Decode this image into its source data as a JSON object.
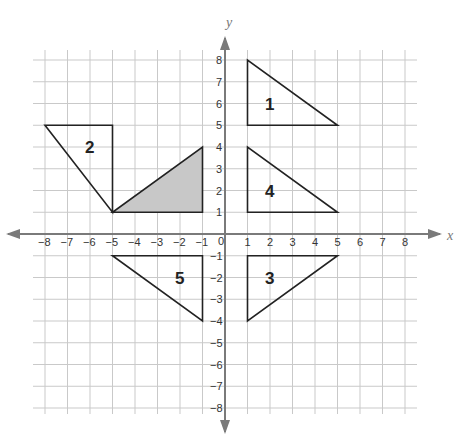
{
  "axes": {
    "x_label": "x",
    "y_label": "y",
    "x_range": [
      -8,
      8
    ],
    "y_range": [
      -8,
      8
    ],
    "origin_label": "0",
    "x_ticks": [
      "−8",
      "−7",
      "−6",
      "−5",
      "−4",
      "−3",
      "−2",
      "−1",
      "1",
      "2",
      "3",
      "4",
      "5",
      "6",
      "7",
      "8"
    ],
    "y_ticks": [
      "8",
      "7",
      "6",
      "5",
      "4",
      "3",
      "2",
      "1",
      "−1",
      "−2",
      "−3",
      "−4",
      "−5",
      "−6",
      "−7",
      "−8"
    ]
  },
  "colors": {
    "grid": "#c9c9c9",
    "axis": "#7a7a7a",
    "outline": "#222222",
    "shaded_fill": "#c8c8c8"
  },
  "shapes": [
    {
      "id": "shaded",
      "label": "",
      "shaded": true,
      "vertices": [
        [
          -5,
          1
        ],
        [
          -1,
          1
        ],
        [
          -1,
          4
        ]
      ],
      "label_at": null
    },
    {
      "id": "1",
      "label": "1",
      "shaded": false,
      "vertices": [
        [
          1,
          8
        ],
        [
          1,
          5
        ],
        [
          5,
          5
        ]
      ],
      "label_at": [
        2,
        6
      ]
    },
    {
      "id": "2",
      "label": "2",
      "shaded": false,
      "vertices": [
        [
          -8,
          5
        ],
        [
          -5,
          5
        ],
        [
          -5,
          1
        ]
      ],
      "label_at": [
        -6,
        4
      ]
    },
    {
      "id": "3",
      "label": "3",
      "shaded": false,
      "vertices": [
        [
          1,
          -1
        ],
        [
          5,
          -1
        ],
        [
          1,
          -4
        ]
      ],
      "label_at": [
        2,
        -2
      ]
    },
    {
      "id": "4",
      "label": "4",
      "shaded": false,
      "vertices": [
        [
          1,
          4
        ],
        [
          1,
          1
        ],
        [
          5,
          1
        ]
      ],
      "label_at": [
        2,
        2
      ]
    },
    {
      "id": "5",
      "label": "5",
      "shaded": false,
      "vertices": [
        [
          -5,
          -1
        ],
        [
          -1,
          -1
        ],
        [
          -1,
          -4
        ]
      ],
      "label_at": [
        -2,
        -2
      ]
    }
  ]
}
